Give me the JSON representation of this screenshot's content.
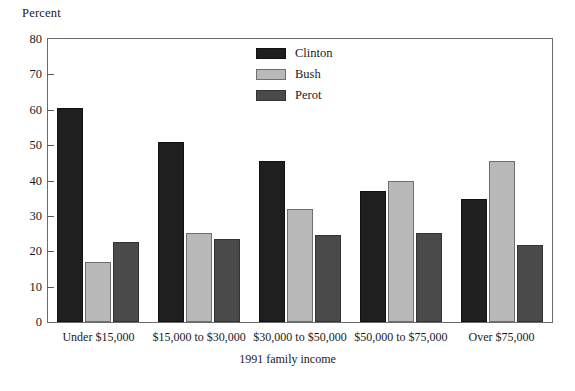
{
  "chart_data": {
    "type": "bar",
    "title": "",
    "subtitle": "",
    "ylabel": "Percent",
    "xlabel": "1991 family income",
    "ylim": [
      0,
      80
    ],
    "yticks": [
      0,
      10,
      20,
      30,
      40,
      50,
      60,
      70,
      80
    ],
    "grid": false,
    "legend_position": "upper-center",
    "categories": [
      "Under $15,000",
      "$15,000 to $30,000",
      "$30,000 to $50,000",
      "$50,000 to $75,000",
      "Over $75,000"
    ],
    "series": [
      {
        "name": "Clinton",
        "color": "#1f1f1f",
        "values": [
          60.5,
          51.0,
          45.5,
          37.0,
          34.8
        ]
      },
      {
        "name": "Bush",
        "color": "#b9b9b9",
        "values": [
          17.0,
          25.3,
          32.0,
          40.0,
          45.5
        ]
      },
      {
        "name": "Perot",
        "color": "#4a4a4a",
        "values": [
          22.5,
          23.6,
          24.6,
          25.2,
          21.7
        ]
      }
    ]
  },
  "legend": {
    "items": [
      {
        "label": "Clinton",
        "swatch": "clinton-swatch"
      },
      {
        "label": "Bush",
        "swatch": "bush-swatch"
      },
      {
        "label": "Perot",
        "swatch": "perot-swatch"
      }
    ]
  },
  "axes": {
    "y_title": "Percent",
    "x_title": "1991 family income",
    "y_tick_labels": [
      "80",
      "70",
      "60",
      "50",
      "40",
      "30",
      "20",
      "10",
      "0"
    ]
  }
}
